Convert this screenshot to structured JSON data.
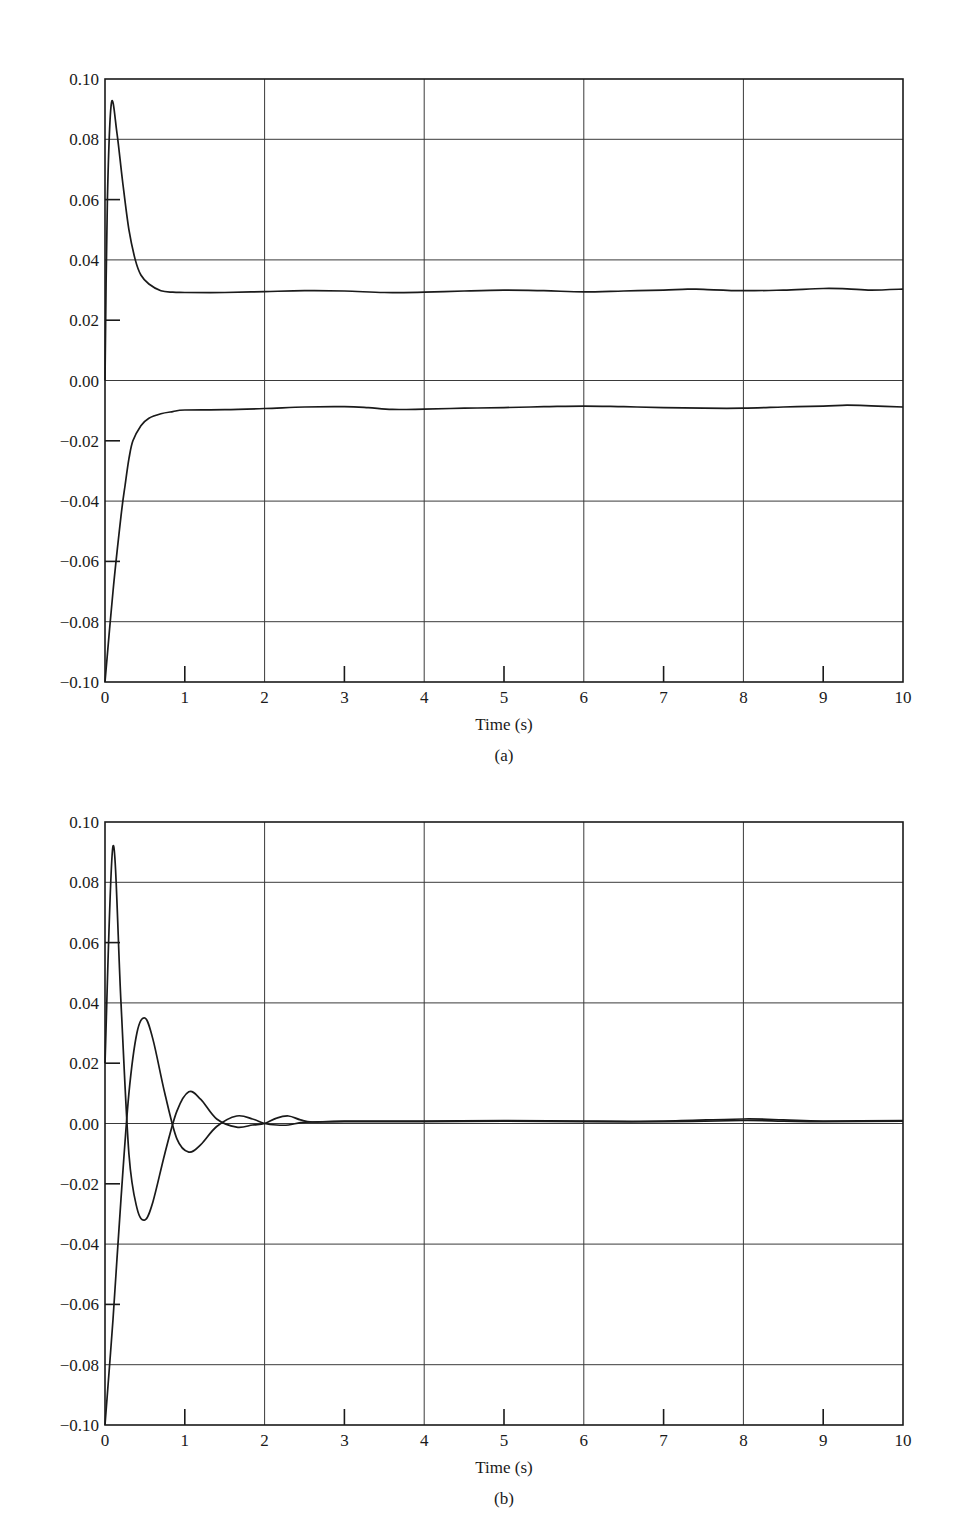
{
  "chart_data": [
    {
      "id": "a",
      "type": "line",
      "caption": "(a)",
      "title": "",
      "xlabel": "Time (s)",
      "ylabel": "",
      "xlim": [
        0,
        10
      ],
      "ylim": [
        -0.1,
        0.1
      ],
      "grid": true,
      "x_ticks": [
        "0",
        "1",
        "2",
        "3",
        "4",
        "5",
        "6",
        "7",
        "8",
        "9",
        "10"
      ],
      "y_ticks": [
        "0.10",
        "0.08",
        "0.06",
        "0.04",
        "0.02",
        "0.00",
        "−0.02",
        "−0.04",
        "−0.06",
        "−0.08",
        "−0.10"
      ],
      "legend": [],
      "series": [
        {
          "name": "upper response",
          "x": [
            0,
            0.03,
            0.08,
            0.15,
            0.22,
            0.3,
            0.38,
            0.45,
            0.55,
            0.7,
            0.85,
            1.0,
            1.5,
            2.0,
            2.5,
            3.0,
            3.5,
            4.0,
            4.5,
            5.0,
            5.5,
            6.0,
            6.5,
            7.0,
            7.3,
            7.5,
            8.0,
            8.5,
            9.0,
            9.3,
            9.6,
            10.0
          ],
          "values": [
            0.0,
            0.06,
            0.092,
            0.082,
            0.066,
            0.05,
            0.04,
            0.035,
            0.032,
            0.0298,
            0.0293,
            0.0292,
            0.0292,
            0.0295,
            0.0298,
            0.0297,
            0.0292,
            0.0293,
            0.0297,
            0.03,
            0.0298,
            0.0294,
            0.0297,
            0.03,
            0.0303,
            0.0302,
            0.0298,
            0.03,
            0.0305,
            0.0304,
            0.03,
            0.0303
          ]
        },
        {
          "name": "lower response",
          "x": [
            0,
            0.1,
            0.2,
            0.25,
            0.3,
            0.35,
            0.45,
            0.55,
            0.7,
            0.85,
            1.0,
            1.5,
            2.0,
            2.5,
            3.0,
            3.3,
            3.6,
            4.0,
            4.5,
            5.0,
            5.5,
            6.0,
            6.5,
            7.0,
            7.5,
            8.0,
            8.5,
            9.0,
            9.3,
            9.6,
            10.0
          ],
          "values": [
            -0.1,
            -0.07,
            -0.045,
            -0.035,
            -0.026,
            -0.02,
            -0.015,
            -0.0125,
            -0.011,
            -0.0103,
            -0.0098,
            -0.0097,
            -0.0093,
            -0.0088,
            -0.0087,
            -0.009,
            -0.0096,
            -0.0095,
            -0.0092,
            -0.009,
            -0.0087,
            -0.0085,
            -0.0087,
            -0.009,
            -0.0092,
            -0.0092,
            -0.0088,
            -0.0085,
            -0.0082,
            -0.0084,
            -0.0088
          ]
        }
      ]
    },
    {
      "id": "b",
      "type": "line",
      "caption": "(b)",
      "title": "",
      "xlabel": "Time (s)",
      "ylabel": "",
      "xlim": [
        0,
        10
      ],
      "ylim": [
        -0.1,
        0.1
      ],
      "grid": true,
      "x_ticks": [
        "0",
        "1",
        "2",
        "3",
        "4",
        "5",
        "6",
        "7",
        "8",
        "9",
        "10"
      ],
      "y_ticks": [
        "0.10",
        "0.08",
        "0.06",
        "0.04",
        "0.02",
        "0.00",
        "−0.02",
        "−0.04",
        "−0.06",
        "−0.08",
        "−0.10"
      ],
      "legend": [],
      "series": [
        {
          "name": "response 1 (starts at 0.02)",
          "x": [
            0,
            0.1,
            0.2,
            0.3,
            0.4,
            0.5,
            0.6,
            0.75,
            0.9,
            1.05,
            1.2,
            1.4,
            1.65,
            1.85,
            2.0,
            2.15,
            2.3,
            2.45,
            2.6,
            3.0,
            4.0,
            5.0,
            6.0,
            7.0,
            8.0,
            8.5,
            9.0,
            10.0
          ],
          "values": [
            0.02,
            0.092,
            0.04,
            -0.01,
            -0.028,
            -0.032,
            -0.026,
            -0.01,
            0.004,
            0.0105,
            0.008,
            0.0015,
            -0.0012,
            -0.0005,
            0.0,
            0.0018,
            0.0025,
            0.0012,
            0.0005,
            0.0008,
            0.0008,
            0.001,
            0.0008,
            0.0008,
            0.0015,
            0.0012,
            0.0008,
            0.001
          ]
        },
        {
          "name": "response 2 (starts at -0.10)",
          "x": [
            0,
            0.1,
            0.2,
            0.3,
            0.4,
            0.5,
            0.6,
            0.75,
            0.9,
            1.05,
            1.2,
            1.4,
            1.65,
            1.85,
            2.0,
            2.15,
            2.3,
            2.45,
            2.6,
            3.0,
            4.0,
            5.0,
            6.0,
            7.0,
            8.0,
            8.5,
            9.0,
            10.0
          ],
          "values": [
            -0.1,
            -0.065,
            -0.025,
            0.01,
            0.03,
            0.035,
            0.028,
            0.01,
            -0.005,
            -0.0095,
            -0.007,
            -0.001,
            0.0025,
            0.0015,
            0.0,
            -0.0005,
            -0.0005,
            0.0003,
            0.0005,
            0.0006,
            0.0006,
            0.0008,
            0.0006,
            0.0006,
            0.001,
            0.0008,
            0.0006,
            0.0008
          ]
        }
      ]
    }
  ]
}
